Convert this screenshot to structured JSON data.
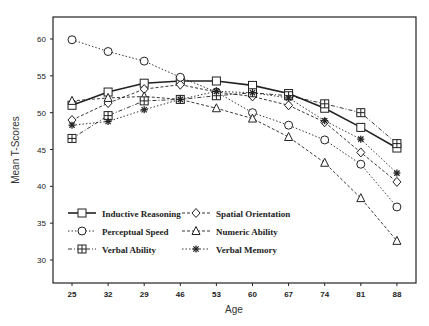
{
  "chart_data": {
    "type": "line",
    "title": "",
    "xlabel": "Age",
    "ylabel": "Mean T-Scores",
    "categories": [
      "25",
      "32",
      "29",
      "46",
      "53",
      "60",
      "67",
      "74",
      "81",
      "88"
    ],
    "y_ticks": [
      30,
      35,
      40,
      45,
      50,
      55,
      60
    ],
    "ylim": [
      27,
      62
    ],
    "grid": false,
    "legend_position": "inside-lower-left",
    "series": [
      {
        "name": "Inductive Reasoning",
        "marker": "square",
        "line": "solid",
        "values": [
          51.0,
          52.8,
          54.0,
          54.3,
          54.3,
          53.7,
          52.6,
          50.6,
          48.0,
          45.2
        ]
      },
      {
        "name": "Spatial Orientation",
        "marker": "diamond",
        "line": "dash",
        "values": [
          49.0,
          51.3,
          53.2,
          53.8,
          52.8,
          52.2,
          51.0,
          48.7,
          44.6,
          40.6
        ]
      },
      {
        "name": "Perceptual Speed",
        "marker": "circle",
        "line": "dot",
        "values": [
          59.9,
          58.3,
          57.0,
          54.8,
          52.8,
          50.0,
          48.3,
          46.3,
          43.0,
          37.2
        ]
      },
      {
        "name": "Numeric Ability",
        "marker": "triangle",
        "line": "dash",
        "values": [
          51.6,
          52.0,
          52.2,
          51.8,
          50.6,
          49.2,
          46.7,
          43.2,
          38.4,
          32.6
        ]
      },
      {
        "name": "Verbal Ability",
        "marker": "plus-square",
        "line": "dashdot",
        "values": [
          46.5,
          49.6,
          51.6,
          51.8,
          52.3,
          52.7,
          52.3,
          51.2,
          50.0,
          45.8
        ]
      },
      {
        "name": "Verbal Memory",
        "marker": "star",
        "line": "dot",
        "values": [
          48.3,
          48.8,
          50.4,
          51.8,
          52.9,
          52.7,
          52.0,
          48.9,
          46.4,
          41.8
        ]
      }
    ]
  },
  "legend": {
    "items": [
      {
        "label": "Inductive Reasoning",
        "marker": "square"
      },
      {
        "label": "Spatial Orientation",
        "marker": "diamond"
      },
      {
        "label": "Perceptual Speed",
        "marker": "circle"
      },
      {
        "label": "Numeric Ability",
        "marker": "triangle"
      },
      {
        "label": "Verbal Ability",
        "marker": "plus-square"
      },
      {
        "label": "Verbal Memory",
        "marker": "star"
      }
    ]
  },
  "colors": {
    "ink": "#222222",
    "background": "#ffffff"
  }
}
